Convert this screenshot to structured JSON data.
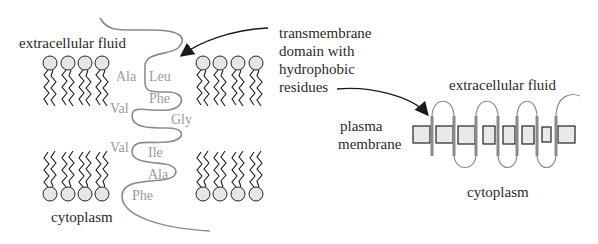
{
  "figure": {
    "left_panel": {
      "top_label": "extracellular fluid",
      "bottom_label": "cytoplasm",
      "amino_acids": [
        {
          "name": "Ala",
          "x": 116,
          "y": 81
        },
        {
          "name": "Leu",
          "x": 149,
          "y": 81
        },
        {
          "name": "Phe",
          "x": 149,
          "y": 103
        },
        {
          "name": "Val",
          "x": 110,
          "y": 113
        },
        {
          "name": "Gly",
          "x": 171,
          "y": 124
        },
        {
          "name": "Val",
          "x": 110,
          "y": 152
        },
        {
          "name": "Ile",
          "x": 148,
          "y": 157
        },
        {
          "name": "Ala",
          "x": 148,
          "y": 179
        },
        {
          "name": "Phe",
          "x": 132,
          "y": 200
        }
      ],
      "phospholipid_columns_per_leaflet": 4
    },
    "callout": {
      "lines": [
        "transmembrane",
        "domain with",
        "hydrophobic",
        "residues"
      ]
    },
    "right_panel": {
      "top_label": "extracellular fluid",
      "side_label_lines": [
        "plasma",
        "membrane"
      ],
      "bottom_label": "cytoplasm",
      "transmembrane_segments": 7
    },
    "colors": {
      "text": "#2a2a2a",
      "amino_acid_text": "#9a9a9a",
      "chain": "#8c8c8c",
      "lipid_head_fill": "#e6e6e6",
      "lipid_stroke": "#1a1a1a",
      "helix": "#8a8a8a",
      "membrane_box_fill": "#e9e9e9"
    }
  }
}
